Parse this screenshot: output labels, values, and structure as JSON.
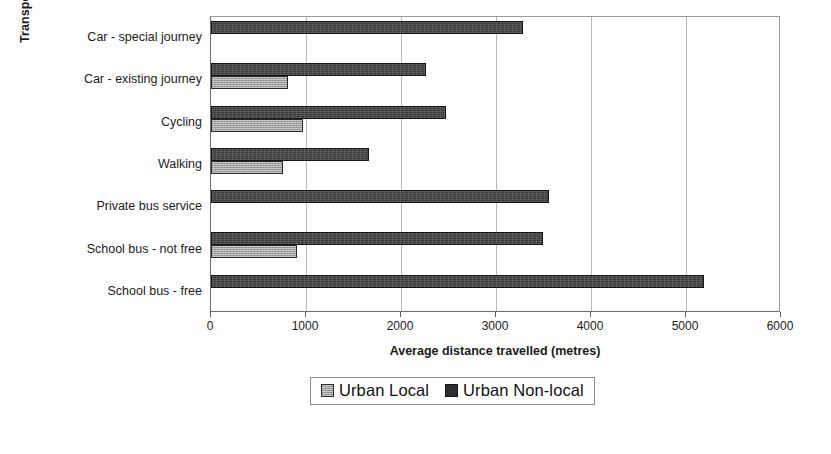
{
  "chart_data": {
    "type": "bar",
    "orientation": "horizontal",
    "title": "",
    "xlabel": "Average distance travelled (metres)",
    "ylabel": "Transport arrangements",
    "xlim": [
      0,
      6000
    ],
    "xticks": [
      0,
      1000,
      2000,
      3000,
      4000,
      5000,
      6000
    ],
    "xtick_labels": [
      "0",
      "1000",
      "2000",
      "3000",
      "4000",
      "5000",
      "6000"
    ],
    "grid": "vertical",
    "legend_position": "below-axis-centre",
    "categories": [
      "Car - special journey",
      "Car - existing journey",
      "Cycling",
      "Walking",
      "Private bus service",
      "School bus - not free",
      "School bus - free"
    ],
    "series": [
      {
        "name": "Urban Local",
        "color": "#9d9d9d",
        "values": [
          0,
          810,
          970,
          760,
          0,
          900,
          0
        ]
      },
      {
        "name": "Urban Non-local",
        "color": "#3b3b3b",
        "values": [
          3285,
          2265,
          2470,
          1660,
          3555,
          3490,
          5190
        ]
      }
    ]
  },
  "legend": {
    "entries": [
      {
        "label": "Urban Local",
        "swatch": "local"
      },
      {
        "label": "Urban Non-local",
        "swatch": "nonlocal"
      }
    ]
  }
}
